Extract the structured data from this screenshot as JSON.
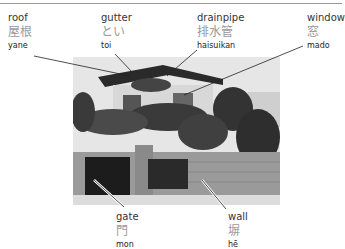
{
  "diagram": {
    "labels": [
      {
        "id": "roof",
        "english": "roof",
        "japanese": "屋根",
        "romaji": "yane"
      },
      {
        "id": "gutter",
        "english": "gutter",
        "japanese": "とい",
        "romaji": "toi"
      },
      {
        "id": "drainpipe",
        "english": "drainpipe",
        "japanese": "排水管",
        "romaji": "haisuikan"
      },
      {
        "id": "window",
        "english": "window",
        "japanese": "窓",
        "romaji": "mado"
      },
      {
        "id": "gate",
        "english": "gate",
        "japanese": "門",
        "romaji": "mon"
      },
      {
        "id": "wall",
        "english": "wall",
        "japanese": "塀",
        "romaji": "hē"
      }
    ]
  },
  "colors": {
    "leader_line": "#222222",
    "japanese_text": "#9a9a9a",
    "rule": "#9a9a9a"
  }
}
